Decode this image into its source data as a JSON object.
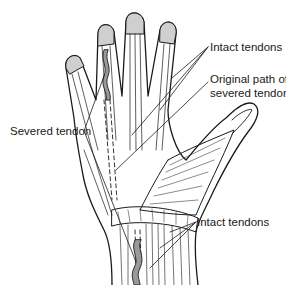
{
  "figure": {
    "colors": {
      "line": "#1a1a1a",
      "tendon_fill": "#9a9a9a",
      "nail_shade": "#cfcfcf",
      "background": "#ffffff"
    },
    "labels": {
      "intact_tendons_top": "Intact tendons",
      "original_path_line1": "Original path of",
      "original_path_line2": "severed tendon",
      "severed_tendon": "Severed tendon",
      "intact_tendons_bottom": "Intact tendons"
    }
  }
}
